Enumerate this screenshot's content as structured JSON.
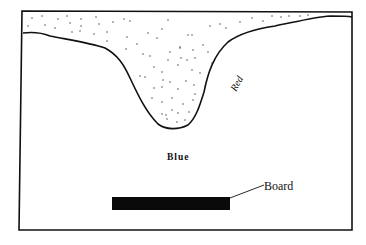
{
  "diagram": {
    "labels": {
      "red": "Red",
      "blue": "Blue",
      "board": "Board"
    },
    "colors": {
      "ink": "#111111",
      "background": "#ffffff",
      "board_fill": "#0a0a0a"
    }
  }
}
